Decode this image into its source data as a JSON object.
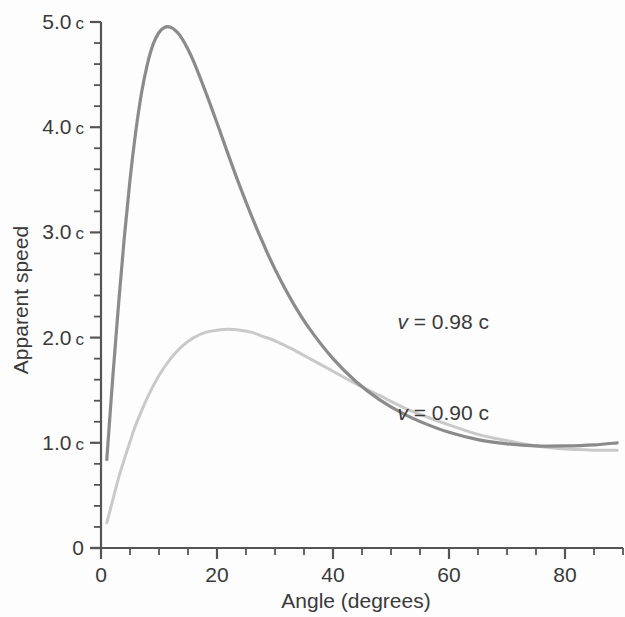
{
  "chart_data": {
    "type": "line",
    "title": "",
    "subtitle": "",
    "xlabel": "Angle (degrees)",
    "ylabel": "Apparent speed",
    "xlim": [
      0,
      90
    ],
    "ylim": [
      0,
      5
    ],
    "grid": false,
    "legend_position": "inline-annotations",
    "x_ticks": [
      {
        "value": 0,
        "label": "0"
      },
      {
        "value": 20,
        "label": "20"
      },
      {
        "value": 40,
        "label": "40"
      },
      {
        "value": 60,
        "label": "60"
      },
      {
        "value": 80,
        "label": "80"
      }
    ],
    "x_minor_tick_step": 5,
    "y_ticks": [
      {
        "value": 0,
        "label": "0",
        "unit": ""
      },
      {
        "value": 1,
        "label": "1.0",
        "unit": "c"
      },
      {
        "value": 2,
        "label": "2.0",
        "unit": "c"
      },
      {
        "value": 3,
        "label": "3.0",
        "unit": "c"
      },
      {
        "value": 4,
        "label": "4.0",
        "unit": "c"
      },
      {
        "value": 5,
        "label": "5.0",
        "unit": "c"
      }
    ],
    "y_minor_tick_step": 0.2,
    "annotations": [
      {
        "id": "label-098",
        "text_prefix": "v",
        "text_rest": " = 0.98 c",
        "x": 59,
        "y": 2.08
      },
      {
        "id": "label-090",
        "text_prefix": "v",
        "text_rest": " = 0.90 c",
        "x": 59,
        "y": 1.22
      }
    ],
    "series": [
      {
        "name": "v = 0.98 c",
        "color": "#8b8b8b",
        "line_width": 3.2,
        "beta": 0.98,
        "peak": {
          "x": 12,
          "y": 4.95
        },
        "x": [
          1,
          2,
          3,
          4,
          5,
          6,
          7,
          8,
          9,
          10,
          11,
          12,
          13,
          14,
          15,
          16,
          18,
          20,
          22,
          24,
          26,
          28,
          30,
          33,
          36,
          40,
          44,
          48,
          52,
          56,
          60,
          65,
          70,
          75,
          80,
          85,
          89
        ],
        "values": [
          0.84,
          1.6,
          2.3,
          2.94,
          3.5,
          3.96,
          4.33,
          4.6,
          4.79,
          4.9,
          4.95,
          4.95,
          4.91,
          4.84,
          4.74,
          4.62,
          4.34,
          4.04,
          3.73,
          3.43,
          3.15,
          2.89,
          2.65,
          2.34,
          2.08,
          1.8,
          1.58,
          1.41,
          1.28,
          1.18,
          1.1,
          1.03,
          0.99,
          0.97,
          0.97,
          0.98,
          1.0
        ]
      },
      {
        "name": "v = 0.90 c",
        "color": "#c9c9c9",
        "line_width": 3.0,
        "beta": 0.9,
        "peak": {
          "x": 24,
          "y": 2.07
        },
        "x": [
          1,
          2,
          3,
          4,
          5,
          6,
          8,
          10,
          12,
          14,
          16,
          18,
          20,
          22,
          24,
          26,
          28,
          30,
          33,
          36,
          40,
          44,
          48,
          52,
          56,
          60,
          65,
          70,
          75,
          80,
          85,
          89
        ],
        "values": [
          0.24,
          0.45,
          0.66,
          0.84,
          1.01,
          1.17,
          1.43,
          1.64,
          1.8,
          1.92,
          2.0,
          2.05,
          2.07,
          2.08,
          2.07,
          2.05,
          2.01,
          1.97,
          1.89,
          1.8,
          1.68,
          1.56,
          1.45,
          1.34,
          1.25,
          1.17,
          1.08,
          1.02,
          0.97,
          0.94,
          0.93,
          0.93
        ]
      }
    ]
  },
  "axes": {
    "y_axis_name": "apparent-speed-axis",
    "x_axis_name": "angle-axis"
  }
}
